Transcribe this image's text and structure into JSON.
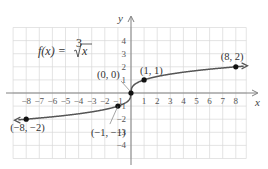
{
  "chart_data": {
    "type": "line",
    "function": "cube root",
    "xlabel": "x",
    "ylabel": "y",
    "xlim": [
      -9,
      8.8
    ],
    "ylim": [
      -5,
      5
    ],
    "grid": true,
    "x_ticks": [
      -8,
      -7,
      -6,
      -5,
      -4,
      -3,
      -2,
      -1,
      1,
      2,
      3,
      4,
      5,
      6,
      7,
      8
    ],
    "y_ticks": [
      -4,
      -3,
      -2,
      -1,
      1,
      2,
      3,
      4
    ],
    "labeled_points": [
      {
        "x": -8,
        "y": -2,
        "label": "(−8, −2)"
      },
      {
        "x": -1,
        "y": -1,
        "label": "(−1, −1)"
      },
      {
        "x": 0,
        "y": 0,
        "label": "(0, 0)"
      },
      {
        "x": 1,
        "y": 1,
        "label": "(1, 1)"
      },
      {
        "x": 8,
        "y": 2,
        "label": "(8, 2)"
      }
    ],
    "curve_color": "#555555",
    "grid_color": "#d9d9d9",
    "axis_color": "#808080"
  },
  "labels": {
    "title_prefix": "f(x) = ",
    "root_index": "3",
    "radicand": "x",
    "x_axis": "x",
    "y_axis": "y"
  }
}
